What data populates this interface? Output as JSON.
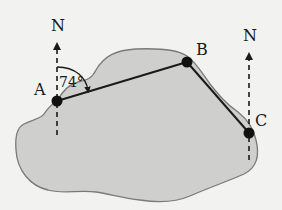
{
  "diagram": {
    "points": [
      {
        "id": "A",
        "label": "A"
      },
      {
        "id": "B",
        "label": "B"
      },
      {
        "id": "C",
        "label": "C"
      }
    ],
    "north_labels": [
      "N",
      "N"
    ],
    "angle_label": "74°",
    "segments": [
      {
        "from": "A",
        "to": "B"
      },
      {
        "from": "B",
        "to": "C"
      }
    ],
    "colors": {
      "background": "#f2f2f0",
      "region_fill": "#cfcfcd",
      "region_stroke": "#7a7a7a",
      "ink": "#1a1a1a"
    }
  }
}
